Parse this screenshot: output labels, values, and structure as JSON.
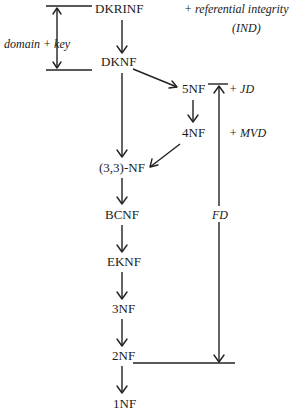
{
  "diagram": {
    "type": "normal-form-hierarchy",
    "nodes": {
      "dkrinf": "DKRINF",
      "dknf": "DKNF",
      "nf5": "5NF",
      "nf4": "4NF",
      "nf33": "(3,3)-NF",
      "bcnf": "BCNF",
      "eknf": "EKNF",
      "nf3": "3NF",
      "nf2": "2NF",
      "nf1": "1NF"
    },
    "annotations": {
      "domain_key": "domain + key",
      "ref_integrity": "+ referential integrity",
      "ind": "(IND)",
      "jd": "+ JD",
      "mvd": "+ MVD",
      "fd": "FD"
    },
    "edges": [
      [
        "DKRINF",
        "DKNF"
      ],
      [
        "DKNF",
        "5NF"
      ],
      [
        "DKNF",
        "(3,3)-NF"
      ],
      [
        "5NF",
        "4NF"
      ],
      [
        "4NF",
        "(3,3)-NF"
      ],
      [
        "(3,3)-NF",
        "BCNF"
      ],
      [
        "BCNF",
        "EKNF"
      ],
      [
        "EKNF",
        "3NF"
      ],
      [
        "3NF",
        "2NF"
      ],
      [
        "2NF",
        "1NF"
      ]
    ],
    "colors": {
      "ink": "#1a1a1a",
      "background": "#ffffff"
    }
  }
}
